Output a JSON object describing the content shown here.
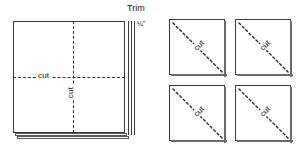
{
  "diagram": {
    "left_panel": {
      "name": "stacked-fabric-square",
      "trim_label": "Trim",
      "trim_measure": "¼\"",
      "cut_label_horizontal": "cut",
      "cut_label_vertical": "cut",
      "layer_count": 3
    },
    "right_panel": {
      "name": "four-cut-squares",
      "squares": [
        {
          "position": "top-left",
          "cut_label": "cut",
          "cut_direction": "diagonal"
        },
        {
          "position": "top-right",
          "cut_label": "cut",
          "cut_direction": "diagonal"
        },
        {
          "position": "bottom-left",
          "cut_label": "cut",
          "cut_direction": "diagonal"
        },
        {
          "position": "bottom-right",
          "cut_label": "cut",
          "cut_direction": "diagonal"
        }
      ]
    },
    "colors": {
      "line": "#3a3a3a",
      "dash": "#2b2b2b",
      "background": "#ffffff",
      "text": "#111111"
    }
  }
}
